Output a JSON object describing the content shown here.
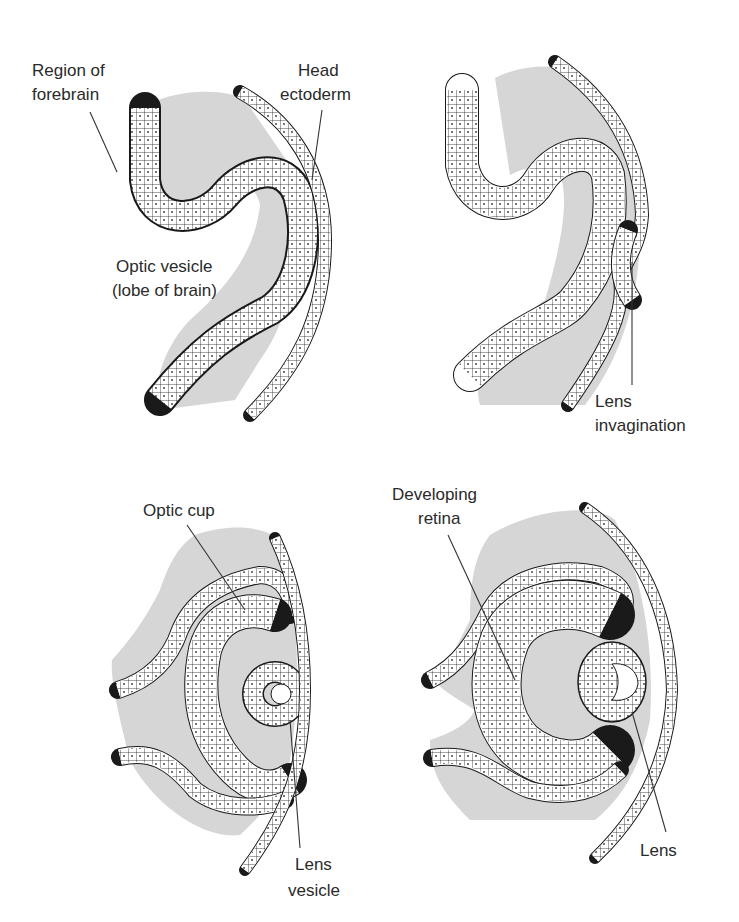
{
  "figure": {
    "panels": [
      {
        "id": "panel-1",
        "labels": [
          {
            "key": "forebrain",
            "line1": "Region of",
            "line2": "forebrain"
          },
          {
            "key": "head_ectoderm",
            "line1": "Head",
            "line2": "ectoderm"
          },
          {
            "key": "optic_vesicle",
            "line1": "Optic vesicle",
            "line2": "(lobe of brain)"
          }
        ]
      },
      {
        "id": "panel-2",
        "labels": [
          {
            "key": "lens_invagination",
            "line1": "Lens",
            "line2": "invagination"
          }
        ]
      },
      {
        "id": "panel-3",
        "labels": [
          {
            "key": "optic_cup",
            "line1": "Optic cup"
          },
          {
            "key": "lens_vesicle",
            "line1": "Lens",
            "line2": "vesicle"
          }
        ]
      },
      {
        "id": "panel-4",
        "labels": [
          {
            "key": "developing_retina",
            "line1": "Developing",
            "line2": "retina"
          },
          {
            "key": "lens",
            "line1": "Lens"
          }
        ]
      }
    ],
    "colors": {
      "mesenchyme": "#d6d6d6",
      "outline": "#1a1a1a",
      "cell_fill": "#ffffff",
      "text": "#2a2a2a"
    }
  }
}
